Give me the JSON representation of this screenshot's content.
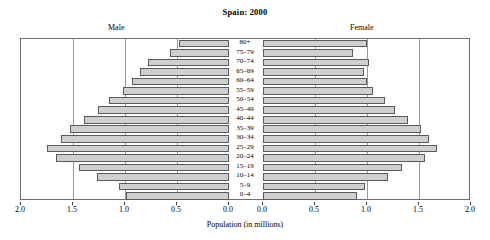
{
  "chart_data": {
    "type": "bar",
    "title": "Spain: 2000",
    "subtype": "population-pyramid",
    "xlabel": "Population (in millions)",
    "ylabel": "",
    "xlim": [
      0,
      2.0
    ],
    "xticks": [
      2.0,
      1.5,
      1.0,
      0.5,
      0.0
    ],
    "xtick_labels_left": [
      "2.0",
      "1.5",
      "1.0",
      "0.5",
      "0.0"
    ],
    "xtick_labels_right": [
      "0.0",
      "0.5",
      "1.0",
      "1.5",
      "2.0"
    ],
    "grid": true,
    "legend_position": "top-inline",
    "categories": [
      "80+",
      "75–79",
      "70–74",
      "65–69",
      "60–64",
      "55–59",
      "50–54",
      "45–49",
      "40–44",
      "35–39",
      "30–34",
      "25–29",
      "20–24",
      "15–19",
      "10–14",
      "5–9",
      "0–4"
    ],
    "series": [
      {
        "name": "Male",
        "side": "left",
        "values": [
          0.48,
          0.57,
          0.78,
          0.86,
          0.93,
          1.02,
          1.15,
          1.26,
          1.39,
          1.53,
          1.62,
          1.75,
          1.66,
          1.44,
          1.27,
          1.06,
          0.99
        ]
      },
      {
        "name": "Female",
        "side": "right",
        "values": [
          1.0,
          0.87,
          1.02,
          0.97,
          1.0,
          1.06,
          1.17,
          1.27,
          1.39,
          1.52,
          1.6,
          1.67,
          1.56,
          1.34,
          1.2,
          0.98,
          0.9
        ]
      }
    ],
    "colors": {
      "bar_fill": "#cfcfcf",
      "bar_stroke": "#5a5a5a",
      "frame": "#6e6e6e",
      "gridline": "#9a9a9a",
      "background": "#ffffff",
      "text": "#000000"
    }
  },
  "labels": {
    "male": "Male",
    "female": "Female"
  }
}
